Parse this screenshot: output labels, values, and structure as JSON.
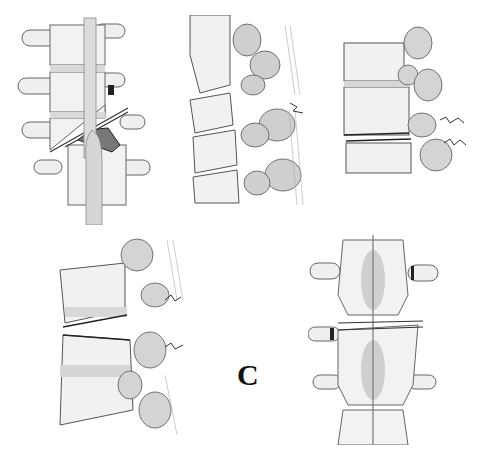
{
  "figure": {
    "label": "C",
    "panels": [
      {
        "id": "panel-1",
        "view": "anterior/posterior view",
        "description": "Translation-rotation fracture with oblique fracture line, displaced spinal cord/ligament, fractured transverse processes"
      },
      {
        "id": "panel-2",
        "view": "lateral view",
        "description": "Flexion-distraction injury with torn posterior ligaments"
      },
      {
        "id": "panel-3",
        "view": "lateral view",
        "description": "Distraction injury through disc and posterior elements"
      },
      {
        "id": "panel-4",
        "view": "lateral view",
        "description": "Separation through vertebral body and posterior ligament complex"
      },
      {
        "id": "panel-5",
        "view": "posterior view",
        "description": "Horizontal fracture through posterior elements with transverse process fractures"
      }
    ]
  },
  "colors": {
    "background": "#ffffff",
    "bone_fill": "#f1f1f1",
    "bone_shade": "#c9c9c9",
    "outline": "#555555",
    "dark_line": "#222222",
    "ligament": "#b8b8b8"
  }
}
